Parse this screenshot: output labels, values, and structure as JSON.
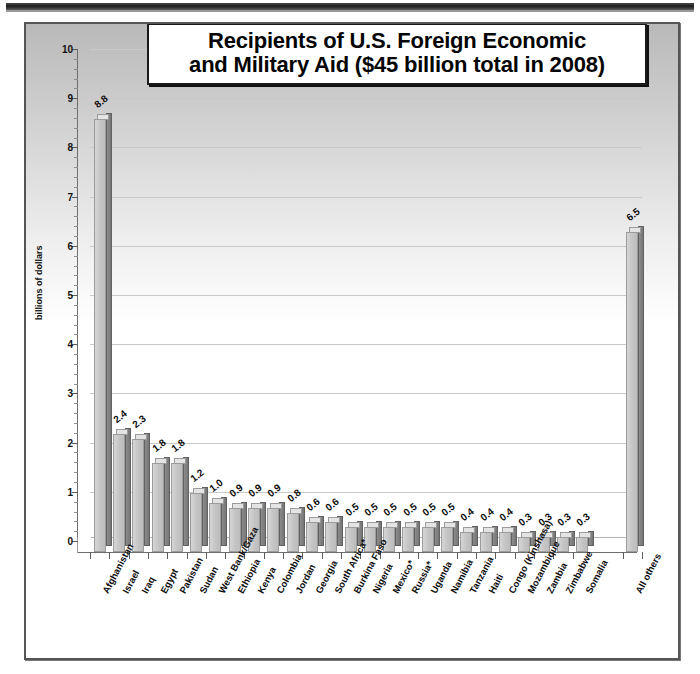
{
  "chart_data": {
    "type": "bar",
    "title": "Recipients of U.S. Foreign Economic and Military Aid ($45 billion total in 2008)",
    "title_lines": [
      "Recipients of U.S. Foreign Economic",
      "and Military Aid ($45 billion total in 2008)"
    ],
    "xlabel": "",
    "ylabel": "billions of dollars",
    "ylim": [
      0,
      10
    ],
    "ytick_labels": [
      "0",
      "1",
      "2",
      "3",
      "4",
      "5",
      "6",
      "7",
      "8",
      "9",
      "10"
    ],
    "ytick_values": [
      0,
      1,
      2,
      3,
      4,
      5,
      6,
      7,
      8,
      9,
      10
    ],
    "grid": true,
    "legend": false,
    "categories": [
      "Afghanistan",
      "Israel",
      "Iraq",
      "Egypt",
      "Pakistan",
      "Sudan",
      "West Bank/Gaza",
      "Ethiopia",
      "Kenya",
      "Colombia",
      "Jordan",
      "Georgia",
      "South Africa*",
      "Burkina Faso",
      "Nigeria",
      "Mexico*",
      "Russia*",
      "Uganda",
      "Namibia",
      "Tanzania",
      "Haiti",
      "Congo (Kinshasa)",
      "Mozambique",
      "Zambia",
      "Zimbabwe",
      "Somalia",
      "All others"
    ],
    "values": [
      8.8,
      2.4,
      2.3,
      1.8,
      1.8,
      1.2,
      1.0,
      0.9,
      0.9,
      0.9,
      0.8,
      0.6,
      0.6,
      0.5,
      0.5,
      0.5,
      0.5,
      0.5,
      0.5,
      0.4,
      0.4,
      0.4,
      0.3,
      0.3,
      0.3,
      0.3,
      6.5
    ],
    "value_labels": [
      "8.8",
      "2.4",
      "2.3",
      "1.8",
      "1.8",
      "1.2",
      "1.0",
      "0.9",
      "0.9",
      "0.9",
      "0.8",
      "0.6",
      "0.6",
      "0.5",
      "0.5",
      "0.5",
      "0.5",
      "0.5",
      "0.5",
      "0.4",
      "0.4",
      "0.4",
      "0.3",
      "0.3",
      "0.3",
      "0.3",
      "6.5"
    ],
    "gap_before_last_category": true,
    "colors": {
      "bar_front": "#c4c4c4",
      "bar_side": "#7b7b7b",
      "bar_top": "#e4e4e4",
      "gridline": "#c9c9c9",
      "axis": "#6e6e6e",
      "text": "#0c0c0c",
      "frame": "#555555",
      "plot_wash_top": "#b9b9b9"
    }
  }
}
